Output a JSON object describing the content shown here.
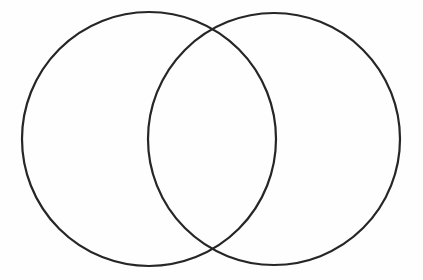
{
  "figure": {
    "background_color": "#fefefe",
    "stroke_color": "#262626",
    "stroke_width": 2.2,
    "width": 423,
    "height": 280
  },
  "chart_data": {
    "type": "diagram",
    "subtype": "venn-2-set",
    "title": "",
    "xlabel": "",
    "ylabel": "",
    "grid": false,
    "legend": null,
    "annotations": [],
    "labels": [],
    "coordinate_space": {
      "units": "pixels",
      "origin": "top-left",
      "xlim": [
        0,
        423
      ],
      "ylim": [
        0,
        280
      ]
    },
    "sets": [
      {
        "id": "set-a",
        "name": "",
        "label": "",
        "shape": "circle",
        "center_x": 149,
        "center_y": 139,
        "radius": 127,
        "bounds": {
          "left": 22,
          "right": 276,
          "top": 12,
          "bottom": 266
        },
        "fill": "none",
        "stroke": "#262626",
        "stroke_width": 2.2
      },
      {
        "id": "set-b",
        "name": "",
        "label": "",
        "shape": "circle",
        "center_x": 274,
        "center_y": 139,
        "radius": 126,
        "bounds": {
          "left": 148,
          "right": 400,
          "top": 13,
          "bottom": 265
        },
        "fill": "none",
        "stroke": "#262626",
        "stroke_width": 2.2
      }
    ],
    "intersection": {
      "id": "set-a-intersect-b",
      "shape": "lens",
      "label": "",
      "fill": "none",
      "point_top": {
        "x": 212,
        "y": 30
      },
      "point_bottom": {
        "x": 212,
        "y": 248
      },
      "center_x": 212,
      "width": 128,
      "height": 218
    },
    "center_distance": 125,
    "overlap_ratio": 0.49
  }
}
